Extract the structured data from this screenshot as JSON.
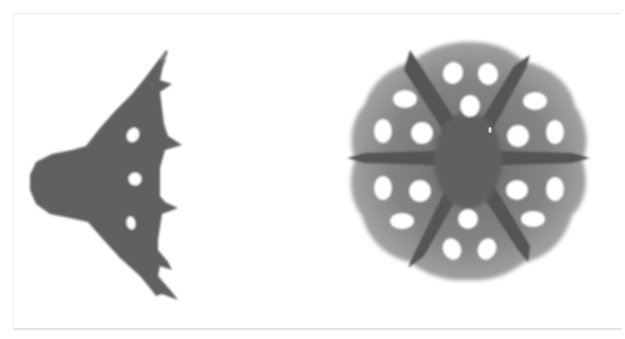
{
  "figure": {
    "panels": [
      {
        "id": "left",
        "shape": "arrowhead-wing",
        "fill": "#5f5f5f",
        "hole_count": 3,
        "spike_count": 6
      },
      {
        "id": "right",
        "shape": "hexagonal-rosette",
        "fill_outer": "#8a8a8a",
        "fill_spokes": "#5a5a5a",
        "hole_count": 18,
        "spoke_count": 6
      }
    ],
    "colors": {
      "background": "#ffffff",
      "frame": "#e8e8e8",
      "hole": "#ffffff"
    }
  }
}
